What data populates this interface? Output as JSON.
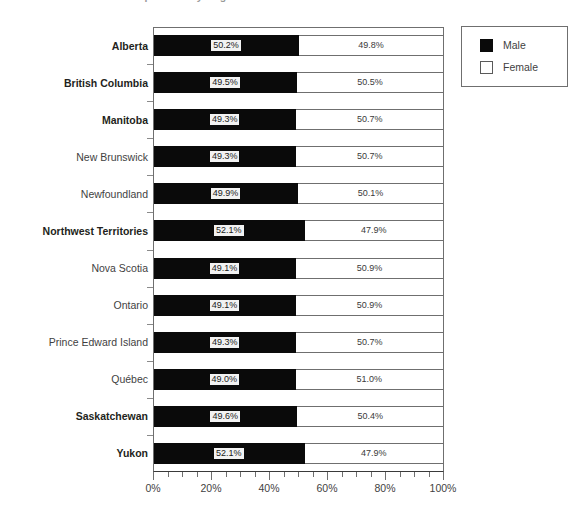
{
  "chart_data": {
    "type": "bar",
    "orientation": "horizontal",
    "stacked": true,
    "normalized": true,
    "title": "Population by Region: Male vs Female",
    "xlabel": "",
    "ylabel": "",
    "xlim": [
      0,
      100
    ],
    "grid": false,
    "legend_position": "top-right",
    "axis": {
      "tick_labels": [
        "0%",
        "20%",
        "40%",
        "60%",
        "80%",
        "100%"
      ],
      "tick_values": [
        0,
        20,
        40,
        60,
        80,
        100
      ],
      "minor_tick_step": 5
    },
    "legend": [
      {
        "name": "Male",
        "color": "#0a0a0a"
      },
      {
        "name": "Female",
        "color": "#ffffff"
      }
    ],
    "categories": [
      "Alberta",
      "British Columbia",
      "Manitoba",
      "New Brunswick",
      "Newfoundland",
      "Northwest Territories",
      "Nova Scotia",
      "Ontario",
      "Prince Edward Island",
      "Québec",
      "Saskatchewan",
      "Yukon"
    ],
    "category_emphasis": [
      true,
      true,
      true,
      false,
      false,
      true,
      false,
      false,
      false,
      false,
      true,
      true
    ],
    "series": [
      {
        "name": "Male",
        "values": [
          50.2,
          49.5,
          49.3,
          49.3,
          49.9,
          52.1,
          49.1,
          49.1,
          49.3,
          49.0,
          49.6,
          52.1
        ],
        "labels": [
          "50.2%",
          "49.5%",
          "49.3%",
          "49.3%",
          "49.9%",
          "52.1%",
          "49.1%",
          "49.1%",
          "49.3%",
          "49.0%",
          "49.6%",
          "52.1%"
        ]
      },
      {
        "name": "Female",
        "values": [
          49.8,
          50.5,
          50.7,
          50.7,
          50.1,
          47.9,
          50.9,
          50.9,
          50.7,
          51.0,
          50.4,
          47.9
        ],
        "labels": [
          "49.8%",
          "50.5%",
          "50.7%",
          "50.7%",
          "50.1%",
          "47.9%",
          "50.9%",
          "50.9%",
          "50.7%",
          "51.0%",
          "50.4%",
          "47.9%"
        ]
      }
    ]
  }
}
